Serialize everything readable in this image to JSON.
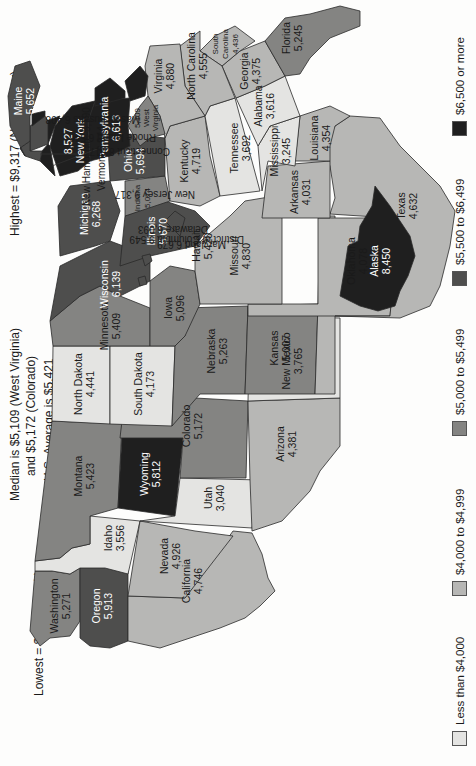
{
  "header": {
    "lowest": "Lowest = $3,040 (Utah)",
    "median_line1": "Median is $5,109 (West Virginia)",
    "median_line2": "and $5,172 (Colorado)",
    "average": "U.S. Average is $5,421",
    "highest": "Highest = $9,317 (New Jersey)"
  },
  "legend": [
    {
      "label": "Less than $4,000",
      "color": "#e4e4e2"
    },
    {
      "label": "$4,000 to $4,999",
      "color": "#b7b7b5"
    },
    {
      "label": "$5,000 to $5,499",
      "color": "#848482"
    },
    {
      "label": "$5,500 to $6,499",
      "color": "#4e4e4d"
    },
    {
      "label": "$6,500 or more",
      "color": "#1f1f1f"
    }
  ],
  "callouts": {
    "new_hampshire": "New Hampshire  5,790",
    "vermont": "Vermont  6,944",
    "massachusetts": "Massachusetts  6,408",
    "rhode_island": "Rhode Island  6,546",
    "connecticut": "Connecticut  8,017",
    "new_jersey": "New Jersey  9,317",
    "delaware": "Delaware  6,093",
    "maryland": "Maryland  6,679",
    "dc": "District of Columbia  9,549"
  },
  "states": {
    "washington": {
      "name": "Washington",
      "value": "5,271"
    },
    "oregon": {
      "name": "Oregon",
      "value": "5,913"
    },
    "california": {
      "name": "California",
      "value": "4,746"
    },
    "idaho": {
      "name": "Idaho",
      "value": "3,556"
    },
    "nevada": {
      "name": "Nevada",
      "value": "4,926"
    },
    "montana": {
      "name": "Montana",
      "value": "5,423"
    },
    "wyoming": {
      "name": "Wyoming",
      "value": "5,812"
    },
    "utah": {
      "name": "Utah",
      "value": "3,040"
    },
    "arizona": {
      "name": "Arizona",
      "value": "4,381"
    },
    "colorado": {
      "name": "Colorado",
      "value": "5,172"
    },
    "new_mexico": {
      "name": "New Mexico",
      "value": "3,765"
    },
    "north_dakota": {
      "name": "North Dakota",
      "value": "4,441"
    },
    "south_dakota": {
      "name": "South Dakota",
      "value": "4,173"
    },
    "nebraska": {
      "name": "Nebraska",
      "value": "5,263"
    },
    "kansas": {
      "name": "Kansas",
      "value": "5,007"
    },
    "oklahoma": {
      "name": "Oklahoma",
      "value": "4,078"
    },
    "texas": {
      "name": "Texas",
      "value": "4,632"
    },
    "minnesota": {
      "name": "Minnesota",
      "value": "5,409"
    },
    "iowa": {
      "name": "Iowa",
      "value": "5,096"
    },
    "missouri": {
      "name": "Missouri",
      "value": "4,830"
    },
    "arkansas": {
      "name": "Arkansas",
      "value": "4,031"
    },
    "louisiana": {
      "name": "Louisiana",
      "value": "4,354"
    },
    "wisconsin": {
      "name": "Wisconsin",
      "value": "6,139"
    },
    "illinois": {
      "name": "Illinois",
      "value": "5,670"
    },
    "michigan": {
      "name": "Michigan",
      "value": "6,268"
    },
    "indiana": {
      "name": "Indiana",
      "value": "5,074"
    },
    "ohio": {
      "name": "Ohio",
      "value": "5,694"
    },
    "kentucky": {
      "name": "Kentucky",
      "value": "4,719"
    },
    "tennessee": {
      "name": "Tennessee",
      "value": "3,692"
    },
    "mississippi": {
      "name": "Mississippi",
      "value": "3,245"
    },
    "alabama": {
      "name": "Alabama",
      "value": "3,616"
    },
    "georgia": {
      "name": "Georgia",
      "value": "4,375"
    },
    "florida": {
      "name": "Florida",
      "value": "5,245"
    },
    "south_carolina": {
      "name": "South Carolina",
      "name1": "South",
      "name2": "Carolina",
      "value": "4,436"
    },
    "north_carolina": {
      "name": "North Carolina",
      "value": "4,555"
    },
    "virginia": {
      "name": "Virginia",
      "value": "4,880"
    },
    "west_virginia": {
      "name": "West Virginia",
      "name1": "West",
      "name2": "Virginia",
      "value": "5,109"
    },
    "pennsylvania": {
      "name": "Pennsylvania",
      "value": "6,613"
    },
    "new_york": {
      "name": "New York",
      "value": "8,527"
    },
    "maine": {
      "name": "Maine",
      "value": "5,652"
    },
    "alaska": {
      "name": "Alaska",
      "value": "8,450"
    },
    "hawaii": {
      "name": "Hawaii",
      "value": "5,420"
    }
  }
}
